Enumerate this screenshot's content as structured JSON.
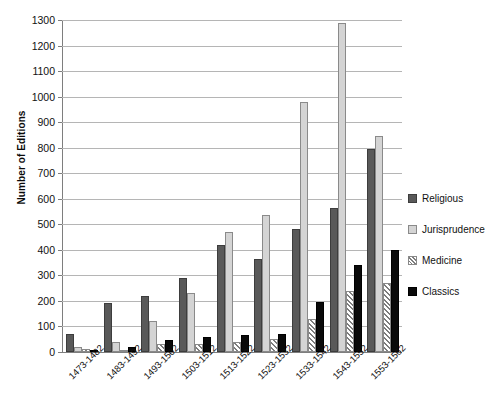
{
  "chart_data": {
    "type": "bar",
    "title": "",
    "xlabel": "",
    "ylabel": "Number of Editions",
    "ylim": [
      0,
      1300
    ],
    "ytick_step": 100,
    "grid": true,
    "legend_position": "right",
    "categories": [
      "1473-1482",
      "1483-1492",
      "1493-1502",
      "1503-1512",
      "1513-1522",
      "1523-1532",
      "1533-1542",
      "1543-1552",
      "1553-1562"
    ],
    "yticks": [
      0,
      100,
      200,
      300,
      400,
      500,
      600,
      700,
      800,
      900,
      1000,
      1100,
      1200,
      1300
    ],
    "series": [
      {
        "name": "Religious",
        "color": "#595959",
        "pattern": "solid",
        "values": [
          70,
          190,
          220,
          290,
          420,
          365,
          480,
          565,
          795
        ]
      },
      {
        "name": "Jurisprudence",
        "color": "#d4d4d4",
        "pattern": "solid",
        "values": [
          20,
          40,
          120,
          230,
          470,
          535,
          980,
          1290,
          845
        ]
      },
      {
        "name": "Medicine",
        "color": "#ffffff",
        "pattern": "diagonal-hatch",
        "values": [
          10,
          5,
          30,
          30,
          40,
          50,
          130,
          240,
          270
        ]
      },
      {
        "name": "Classics",
        "color": "#0a0a0a",
        "pattern": "solid",
        "values": [
          0,
          20,
          48,
          60,
          65,
          70,
          195,
          340,
          400
        ]
      }
    ]
  }
}
